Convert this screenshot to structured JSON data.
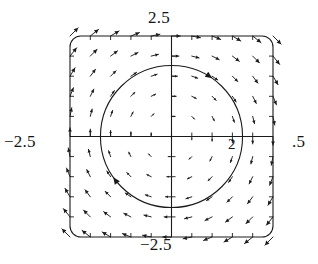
{
  "figure": {
    "kind": "direction-field-phase-portrait",
    "background_color": "#ffffff",
    "ink_color": "#1a1a1a"
  },
  "labels": {
    "top": "2.5",
    "bottom": "−2.5",
    "left": "−2.5",
    "right": ".5",
    "inner_x_tick": "2"
  },
  "chart_data": {
    "type": "scatter",
    "title": "",
    "subtitle": "",
    "xlabel": "",
    "ylabel": "",
    "xlim": [
      -2.5,
      2.5
    ],
    "ylim": [
      -2.5,
      2.5
    ],
    "grid": false,
    "legend": null,
    "axis": {
      "x_axis_y": 0,
      "y_axis_x": 0,
      "tick_count_x": 11,
      "tick_count_y": 11,
      "tick_labels_x": [
        "-2.5",
        "2",
        "2.5"
      ],
      "tick_labels_y": [
        "-2.5",
        "2.5"
      ],
      "frame": "rounded-rectangle"
    },
    "vector_field": {
      "description": "Direction field of a planar autonomous system; unit-length arrow glyphs on an 11x11 grid over [-2.5,2.5] x [-2.5,2.5]; vectors rotate clockwise about the origin.",
      "grid_nx": 11,
      "grid_ny": 11,
      "x_samples": [
        -2.5,
        -2.0,
        -1.5,
        -1.0,
        -0.5,
        0.0,
        0.5,
        1.0,
        1.5,
        2.0,
        2.5
      ],
      "y_samples": [
        -2.5,
        -2.0,
        -1.5,
        -1.0,
        -0.5,
        0.0,
        0.5,
        1.0,
        1.5,
        2.0,
        2.5
      ],
      "formula_u": "y",
      "formula_v": "-x",
      "glyph_length_px": 11,
      "arrow_head": true,
      "note": "arrow magnitude grows with distance from origin; near-origin glyphs render as dots"
    },
    "trajectory": {
      "shape": "circle",
      "center": [
        0.0,
        0.0
      ],
      "radius": 1.75,
      "direction": "clockwise",
      "arrow_markers": [
        {
          "angle_deg": 55,
          "x": 1.0,
          "y": 1.43
        },
        {
          "angle_deg": 215,
          "x": -1.43,
          "y": -1.0
        }
      ],
      "stroke_width": 1.1
    }
  }
}
